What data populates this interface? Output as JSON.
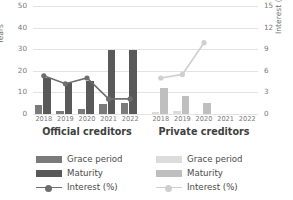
{
  "chart_data": {
    "type": "bar",
    "title": "",
    "subtitle": "",
    "panels": [
      {
        "name": "official",
        "label": "Official creditors",
        "categories": [
          "2018",
          "2019",
          "2020",
          "2021",
          "2022"
        ],
        "series": [
          {
            "name": "Grace period",
            "axis": "left",
            "unit": "Years",
            "color": "#7a7a7a",
            "values": [
              4.0,
              1.5,
              2.5,
              4.5,
              5.0
            ]
          },
          {
            "name": "Maturity",
            "axis": "left",
            "unit": "Years",
            "color": "#595959",
            "values": [
              16.5,
              14.5,
              15.5,
              29.5,
              29.5
            ]
          },
          {
            "name": "Interest (%)",
            "axis": "right",
            "unit": "%",
            "color": "#6e6e6e",
            "values": [
              5.3,
              4.2,
              5.0,
              2.1,
              2.1
            ]
          }
        ]
      },
      {
        "name": "private",
        "label": "Private creditors",
        "categories": [
          "2018",
          "2019",
          "2020",
          "2021",
          "2022"
        ],
        "series": [
          {
            "name": "Grace period",
            "axis": "left",
            "unit": "Years",
            "color": "#dcdcdc",
            "values": [
              1.0,
              1.2,
              0.0,
              null,
              null
            ]
          },
          {
            "name": "Maturity",
            "axis": "left",
            "unit": "Years",
            "color": "#bfbfbf",
            "values": [
              12.0,
              8.5,
              5.0,
              null,
              null
            ]
          },
          {
            "name": "Interest (%)",
            "axis": "right",
            "unit": "%",
            "color": "#cfcfcf",
            "values": [
              5.0,
              5.5,
              9.9,
              null,
              null
            ]
          }
        ]
      }
    ],
    "axes": {
      "left": {
        "label": "Years",
        "ticks": [
          "0",
          "10",
          "20",
          "30",
          "40",
          "50"
        ],
        "min": 0,
        "max": 50,
        "step": 10
      },
      "right": {
        "label": "Interest (%)",
        "ticks": [
          "0",
          "3",
          "6",
          "9",
          "12",
          "15"
        ],
        "min": 0,
        "max": 15,
        "step": 3
      }
    },
    "grid": true,
    "legend_position": "bottom"
  },
  "legends": {
    "official": {
      "grace_label": "Grace period",
      "maturity_label": "Maturity",
      "interest_label": "Interest (%)"
    },
    "private": {
      "grace_label": "Grace period",
      "maturity_label": "Maturity",
      "interest_label": "Interest (%)"
    }
  },
  "colors": {
    "official_grace": "#7a7a7a",
    "official_maturity": "#595959",
    "official_interest": "#6e6e6e",
    "private_grace": "#dcdcdc",
    "private_maturity": "#bfbfbf",
    "private_interest": "#cfcfcf",
    "grid": "#e3e3e3",
    "tick_text": "#7a7a7a",
    "title_text": "#404040"
  }
}
